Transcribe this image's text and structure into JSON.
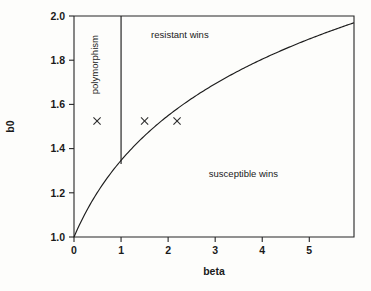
{
  "chart_data": {
    "type": "line",
    "title": "",
    "xlabel": "beta",
    "ylabel": "b0",
    "xlim": [
      0,
      5.95
    ],
    "ylim": [
      1.0,
      2.0
    ],
    "grid": false,
    "legend": null,
    "x_ticks": [
      "0",
      "1",
      "2",
      "3",
      "4",
      "5"
    ],
    "x_tick_values": [
      0,
      1,
      2,
      3,
      4,
      5
    ],
    "y_ticks": [
      "1.0",
      "1.2",
      "1.4",
      "1.6",
      "1.8",
      "2.0"
    ],
    "y_tick_values": [
      1.0,
      1.2,
      1.4,
      1.6,
      1.8,
      2.0
    ],
    "series": [
      {
        "name": "boundary-curve",
        "kind": "curve",
        "description": "separatrix between resistant wins and susceptible wins",
        "formula": "b0 = 1 + 0.5*ln(1+beta)",
        "x": [
          0,
          0.25,
          0.5,
          0.75,
          1.0,
          1.5,
          2.0,
          2.5,
          3.0,
          3.5,
          4.0,
          4.5,
          5.0,
          5.5,
          5.75,
          5.95
        ],
        "y": [
          1.0,
          1.11,
          1.2,
          1.28,
          1.35,
          1.46,
          1.55,
          1.63,
          1.69,
          1.75,
          1.8,
          1.85,
          1.9,
          1.94,
          1.96,
          1.97
        ]
      },
      {
        "name": "polymorphism-boundary",
        "kind": "vertical-line",
        "x": 1.0,
        "y_from": 1.33,
        "y_to": 2.0
      }
    ],
    "markers": [
      {
        "label": "x",
        "x": 0.49,
        "y": 1.525,
        "symbol": "cross"
      },
      {
        "label": "x",
        "x": 1.5,
        "y": 1.525,
        "symbol": "cross"
      },
      {
        "label": "x",
        "x": 2.19,
        "y": 1.525,
        "symbol": "cross"
      }
    ],
    "annotations": [
      {
        "name": "polymorphism-label",
        "text": "polymorphism",
        "x": 0.52,
        "y": 1.78,
        "rotation": -90
      },
      {
        "name": "resistant-wins-label",
        "text": "resistant wins",
        "x": 2.25,
        "y": 1.9,
        "rotation": 0
      },
      {
        "name": "susceptible-wins-label",
        "text": "susceptible wins",
        "x": 3.6,
        "y": 1.27,
        "rotation": 0
      }
    ]
  },
  "axes": {
    "x_label": "beta",
    "y_label": "b0",
    "x_tick_labels": [
      "0",
      "1",
      "2",
      "3",
      "4",
      "5"
    ],
    "y_tick_labels": [
      "1.0",
      "1.2",
      "1.4",
      "1.6",
      "1.8",
      "2.0"
    ]
  },
  "regions": {
    "polymorphism": "polymorphism",
    "resistant": "resistant wins",
    "susceptible": "susceptible wins"
  },
  "colors": {
    "background": "#fdfdfb",
    "ink": "#1a1a1a",
    "axis": "#262626"
  }
}
